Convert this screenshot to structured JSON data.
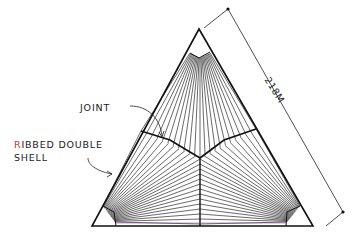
{
  "diagram": {
    "type": "architectural-sketch",
    "labels": {
      "joint": "JOINT",
      "ribbed_double_shell_line1": "RIBBED DOUBLE",
      "ribbed_double_shell_line2": "SHELL",
      "dimension": "218M"
    },
    "colors": {
      "ink": "#1a1a1a",
      "label_accent": "#b5322e",
      "background": "#ffffff"
    }
  }
}
